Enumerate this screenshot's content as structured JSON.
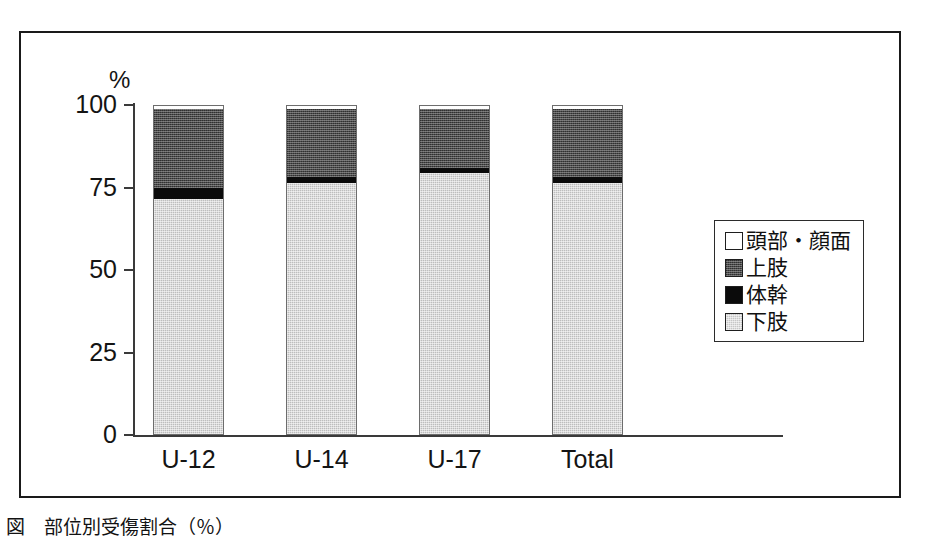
{
  "axis": {
    "y_unit_label": "%",
    "y_ticks": [
      "100",
      "75",
      "50",
      "25",
      "0"
    ],
    "x_ticks": [
      "U-12",
      "U-14",
      "U-17",
      "Total"
    ]
  },
  "legend": {
    "items": [
      {
        "label": "頭部・顔面",
        "swatch": "white-square-icon",
        "color": "#ffffff"
      },
      {
        "label": "上肢",
        "swatch": "dark-gray-square-icon",
        "color": "#4a4a4a"
      },
      {
        "label": "体幹",
        "swatch": "black-square-icon",
        "color": "#0b0b0b"
      },
      {
        "label": "下肢",
        "swatch": "light-gray-square-icon",
        "color": "#c6c6c6"
      }
    ]
  },
  "caption": {
    "text": "図　部位別受傷割合（％）"
  },
  "chart_data": {
    "type": "bar",
    "stacked": true,
    "title": "",
    "subtitle": "",
    "xlabel": "",
    "ylabel": "%",
    "ylim": [
      0,
      100
    ],
    "yticks": [
      0,
      25,
      50,
      75,
      100
    ],
    "grid": false,
    "legend_position": "right",
    "categories": [
      "U-12",
      "U-14",
      "U-17",
      "Total"
    ],
    "series": [
      {
        "name": "下肢",
        "color": "#c6c6c6",
        "values": [
          71.5,
          76.5,
          79.5,
          76.5
        ]
      },
      {
        "name": "体幹",
        "color": "#0b0b0b",
        "values": [
          3.5,
          2.0,
          1.5,
          2.0
        ]
      },
      {
        "name": "上肢",
        "color": "#4a4a4a",
        "values": [
          24.0,
          20.5,
          18.0,
          20.5
        ]
      },
      {
        "name": "頭部・顔面",
        "color": "#ffffff",
        "values": [
          1.0,
          1.0,
          1.0,
          1.0
        ]
      }
    ]
  }
}
